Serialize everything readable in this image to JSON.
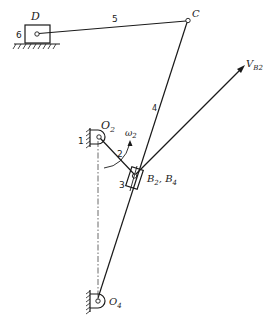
{
  "diagram": {
    "type": "mechanism-linkage",
    "points": {
      "D": "D",
      "C": "C",
      "O2": {
        "base": "O",
        "sub": "2"
      },
      "O4": {
        "base": "O",
        "sub": "4"
      },
      "B": {
        "text": "B",
        "sub1": "2",
        "sep": ", B",
        "sub2": "4"
      }
    },
    "links": {
      "l1": "1",
      "l2": "2",
      "l3": "3",
      "l4": "4",
      "l5": "5",
      "l6": "6"
    },
    "omega": {
      "base": "ω",
      "sub": "2"
    },
    "velocity": {
      "base": "V",
      "sub": "B",
      "sub2": "2"
    }
  }
}
